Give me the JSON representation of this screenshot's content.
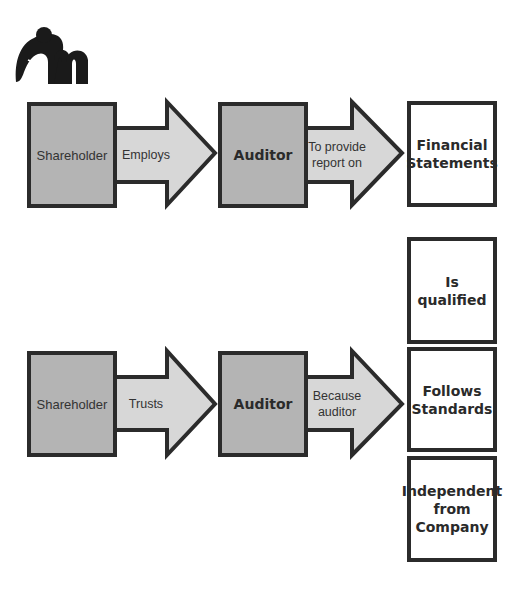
{
  "logo": {
    "icon": "elephant-m-logo",
    "color": "#1a1a1a"
  },
  "colors": {
    "box_fill": "#b4b4b4",
    "arrow_fill": "#d7d7d7",
    "border": "#2b2b2b",
    "result_fill": "#ffffff"
  },
  "row1": {
    "from": "Shareholder",
    "arrow1": "Employs",
    "to": "Auditor",
    "arrow2_line1": "To provide",
    "arrow2_line2": "report on",
    "result_line1": "Financial",
    "result_line2": "Statements"
  },
  "row2": {
    "from": "Shareholder",
    "arrow1": "Trusts",
    "to": "Auditor",
    "arrow2_line1": "Because",
    "arrow2_line2": "auditor",
    "results": [
      {
        "lines": [
          "Is qualified"
        ]
      },
      {
        "lines": [
          "Follows",
          "Standards"
        ]
      },
      {
        "lines": [
          "Independent",
          "from",
          "Company"
        ]
      }
    ]
  }
}
